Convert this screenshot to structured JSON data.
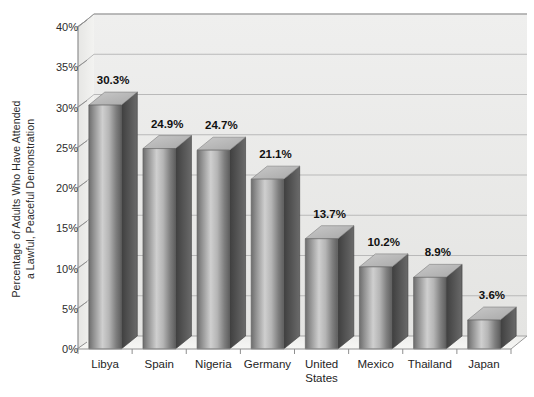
{
  "chart_data": {
    "type": "bar",
    "title": "",
    "subtitle": "",
    "xlabel": "",
    "ylabel_lines": [
      "Percentage of Adults Who Have Attended",
      "a Lawful, Peaceful Demonstration"
    ],
    "ylabel": "Percentage of Adults Who Have Attended a Lawful, Peaceful Demonstration",
    "categories": [
      "Libya",
      "Spain",
      "Nigeria",
      "Germany",
      "United States",
      "Mexico",
      "Thailand",
      "Japan"
    ],
    "category_lines": [
      [
        "Libya"
      ],
      [
        "Spain"
      ],
      [
        "Nigeria"
      ],
      [
        "Germany"
      ],
      [
        "United",
        "States"
      ],
      [
        "Mexico"
      ],
      [
        "Thailand"
      ],
      [
        "Japan"
      ]
    ],
    "values": [
      30.3,
      24.9,
      24.7,
      21.1,
      13.7,
      10.2,
      8.9,
      3.6
    ],
    "value_labels": [
      "30.3%",
      "24.9%",
      "24.7%",
      "21.1%",
      "13.7%",
      "10.2%",
      "8.9%",
      "3.6%"
    ],
    "ylim": [
      0,
      40
    ],
    "ytick_values": [
      0,
      5,
      10,
      15,
      20,
      25,
      30,
      35,
      40
    ],
    "ytick_labels": [
      "0%",
      "5%",
      "10%",
      "15%",
      "20%",
      "25%",
      "30%",
      "35%",
      "40%"
    ],
    "grid": true,
    "legend": "none",
    "style": "3d-column",
    "colors": {
      "plot_background": "#f4f4f2",
      "wall_shade": "#e8e8e6",
      "floor_shade": "#efefed",
      "gridline": "#b9b9b9",
      "axis_line": "#8f8f8f",
      "bar_front_light": "#d6d6d6",
      "bar_front_dark": "#6f6f6f",
      "bar_top": "#cfcfcf",
      "bar_side": "#4a4a4a",
      "text": "#1e1e1e"
    }
  }
}
